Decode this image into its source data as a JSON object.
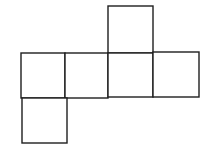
{
  "diagram": {
    "type": "cube-net",
    "stroke_color": "#1e1e1e",
    "background": "#ffffff",
    "face_count": 6,
    "faces": [
      {
        "id": "top",
        "x": 108,
        "y": 6,
        "w": 45,
        "h": 47
      },
      {
        "id": "row-1",
        "x": 21,
        "y": 53,
        "w": 44,
        "h": 45
      },
      {
        "id": "row-2",
        "x": 65,
        "y": 53,
        "w": 43,
        "h": 45
      },
      {
        "id": "row-3",
        "x": 108,
        "y": 53,
        "w": 45,
        "h": 44
      },
      {
        "id": "row-4",
        "x": 153,
        "y": 52,
        "w": 46,
        "h": 45
      },
      {
        "id": "bottom",
        "x": 22,
        "y": 98,
        "w": 45,
        "h": 45
      }
    ]
  }
}
